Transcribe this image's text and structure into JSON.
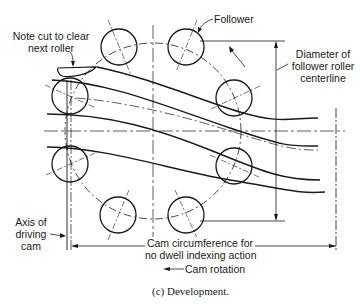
{
  "diagram": {
    "type": "cam development drawing",
    "labels": {
      "note_cut": [
        "Note cut to clear",
        "next roller"
      ],
      "follower": "Follower",
      "diameter": [
        "Diameter of",
        "follower roller",
        "centerline"
      ],
      "axis": [
        "Axis of",
        "driving",
        "cam"
      ],
      "circumference": [
        "Cam circumference for",
        "no dwell indexing action"
      ],
      "rotation": "Cam rotation"
    },
    "caption": "(c) Development.",
    "rollers": [
      {
        "name": "roller-top-left",
        "cx": 119,
        "cy": 47
      },
      {
        "name": "roller-top-right",
        "cx": 186,
        "cy": 47
      },
      {
        "name": "roller-right-upper",
        "cx": 234,
        "cy": 98
      },
      {
        "name": "roller-left-upper",
        "cx": 70,
        "cy": 96
      },
      {
        "name": "roller-left-lower",
        "cx": 70,
        "cy": 164
      },
      {
        "name": "roller-right-lower",
        "cx": 234,
        "cy": 166
      },
      {
        "name": "roller-bottom-left",
        "cx": 118,
        "cy": 215
      },
      {
        "name": "roller-bottom-right",
        "cx": 186,
        "cy": 215
      }
    ],
    "roller_radius": 18,
    "line_color": "#1a1a1a"
  }
}
